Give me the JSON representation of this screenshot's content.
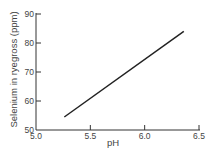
{
  "chart_data": {
    "type": "line",
    "title": "",
    "xlabel": "pH",
    "ylabel": "Selenium in ryegross (ppm)",
    "xlim": [
      5.0,
      6.5
    ],
    "ylim": [
      50,
      90
    ],
    "x_ticks": [
      "5.0",
      "5.5",
      "6.0",
      "6.5"
    ],
    "y_ticks": [
      "50",
      "60",
      "70",
      "80",
      "90"
    ],
    "grid": false,
    "legend": null,
    "series": [
      {
        "name": "Selenium vs pH",
        "x": [
          5.26,
          6.36
        ],
        "y": [
          54.5,
          84
        ]
      }
    ]
  }
}
